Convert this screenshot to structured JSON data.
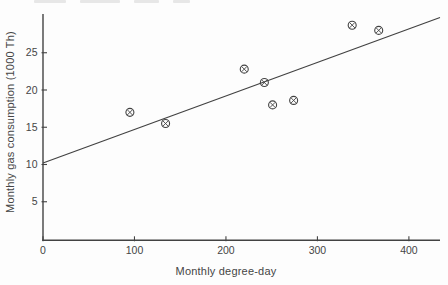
{
  "figure": {
    "xlabel": "Monthly degree-day",
    "ylabel": "Monthly gas consumption (1000 Th)"
  },
  "chart_data": {
    "type": "scatter",
    "title": "",
    "xlabel": "Monthly degree-day",
    "ylabel": "Monthly gas consumption (1000 Th)",
    "x_ticks": [
      0,
      100,
      200,
      300,
      400
    ],
    "y_ticks": [
      5,
      10,
      15,
      20,
      25
    ],
    "xlim": [
      0,
      434
    ],
    "ylim": [
      0,
      30.2
    ],
    "grid": false,
    "legend": "none",
    "marker": "circle-cross",
    "ink_color": "#424242",
    "background_color": "#fdfdfd",
    "points": [
      {
        "x": 95,
        "y": 17.0
      },
      {
        "x": 134,
        "y": 15.5
      },
      {
        "x": 220,
        "y": 22.8
      },
      {
        "x": 242,
        "y": 21.0
      },
      {
        "x": 251,
        "y": 18.0
      },
      {
        "x": 274,
        "y": 18.6
      },
      {
        "x": 338,
        "y": 28.7
      },
      {
        "x": 367,
        "y": 28.0
      }
    ],
    "trend_line": {
      "intercept": 10.2,
      "slope": 0.045,
      "x_start": 0,
      "x_end": 434
    }
  }
}
